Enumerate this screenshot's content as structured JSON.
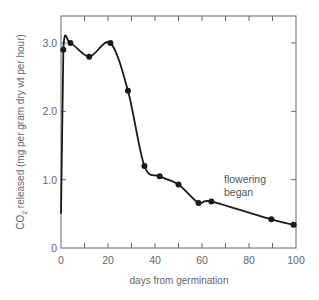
{
  "chart_data": {
    "type": "line",
    "title": "",
    "xlabel": "days from germination",
    "ylabel": "CO2 released (mg per gram dry wt per hour)",
    "ylabel_main": "CO",
    "ylabel_sub": "2",
    "ylabel_rest": " released (mg per gram dry wt per hour)",
    "xlim": [
      0,
      100
    ],
    "ylim": [
      0,
      3.5
    ],
    "x_ticks": [
      0,
      10,
      20,
      30,
      40,
      50,
      60,
      70,
      80,
      90,
      100
    ],
    "x_tick_labels": [
      "0",
      "20",
      "40",
      "60",
      "80",
      "100"
    ],
    "x_tick_label_values": [
      0,
      20,
      40,
      60,
      80,
      100
    ],
    "y_ticks": [
      0,
      1.0,
      2.0,
      3.0
    ],
    "y_tick_labels": [
      "0",
      "1.0",
      "2.0",
      "3.0"
    ],
    "grid": false,
    "legend": null,
    "series": [
      {
        "name": "CO2 released",
        "x": [
          0,
          1,
          4,
          12,
          21,
          28.5,
          35.5,
          42,
          50,
          58.5,
          64,
          89.5,
          99
        ],
        "y": [
          0.5,
          2.9,
          3.0,
          2.8,
          3.0,
          2.3,
          1.2,
          1.05,
          0.93,
          0.66,
          0.68,
          0.42,
          0.34
        ],
        "markers": [
          false,
          true,
          true,
          true,
          true,
          true,
          true,
          true,
          true,
          true,
          true,
          true,
          true
        ]
      }
    ],
    "annotations": [
      {
        "text_line1": "flowering",
        "text_line2": "began",
        "x": 64,
        "y": 0.9
      }
    ]
  }
}
